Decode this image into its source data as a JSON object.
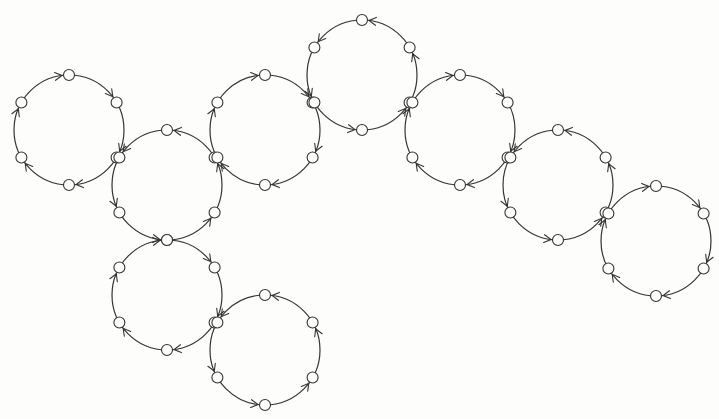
{
  "diagram": {
    "stroke_color": "#333333",
    "background": "#fdfdfc",
    "radius": 55,
    "node_radius": 5.5,
    "cycles": [
      {
        "id": "C1",
        "cx": 69,
        "cy": 130,
        "direction": "cw"
      },
      {
        "id": "C2",
        "cx": 167,
        "cy": 185,
        "direction": "ccw"
      },
      {
        "id": "C3",
        "cx": 265,
        "cy": 130,
        "direction": "cw"
      },
      {
        "id": "C4",
        "cx": 362,
        "cy": 75,
        "direction": "ccw"
      },
      {
        "id": "C5",
        "cx": 460,
        "cy": 130,
        "direction": "cw"
      },
      {
        "id": "C6",
        "cx": 558,
        "cy": 185,
        "direction": "ccw"
      },
      {
        "id": "C7",
        "cx": 656,
        "cy": 241,
        "direction": "cw"
      },
      {
        "id": "C8",
        "cx": 167,
        "cy": 295,
        "direction": "cw"
      },
      {
        "id": "C9",
        "cx": 265,
        "cy": 350,
        "direction": "ccw"
      }
    ],
    "nodes_per_cycle": 6
  }
}
